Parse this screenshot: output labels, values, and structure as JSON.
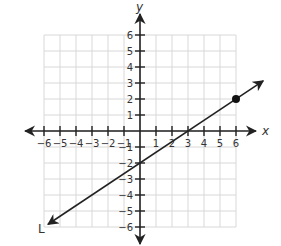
{
  "chart_data": {
    "type": "line",
    "title": "",
    "xlabel": "x",
    "ylabel": "y",
    "xlim": [
      -6,
      6
    ],
    "ylim": [
      -6,
      6
    ],
    "grid": true,
    "x_ticks": [
      -6,
      -5,
      -4,
      -3,
      -2,
      -1,
      1,
      2,
      3,
      4,
      5,
      6
    ],
    "y_ticks": [
      -6,
      -5,
      -4,
      -3,
      -2,
      -1,
      1,
      2,
      3,
      4,
      5,
      6
    ],
    "series": [
      {
        "name": "L",
        "kind": "line with arrows at both ends",
        "slope": 0.6667,
        "intercept": -2,
        "x": [
          -5.75,
          0,
          3,
          6,
          7.7
        ],
        "y": [
          -5.83,
          -2,
          0,
          2,
          3.13
        ]
      }
    ],
    "points": [
      {
        "x": 6,
        "y": 2,
        "style": "filled dot"
      }
    ],
    "annotations": [
      {
        "text": "L",
        "near": "lower-left end of line"
      }
    ]
  },
  "labels": {
    "x_axis": "x",
    "y_axis": "y",
    "line_name": "L"
  },
  "layout": {
    "origin_px": [
      140,
      131
    ],
    "unit_px": 16,
    "line_start": [
      -5.75,
      -5.83
    ],
    "line_end": [
      7.7,
      3.13
    ]
  }
}
